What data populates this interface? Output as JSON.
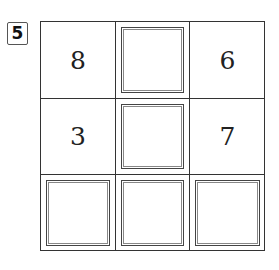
{
  "problem_number": "5",
  "grid": {
    "rows": [
      [
        {
          "value": "8",
          "blank": false
        },
        {
          "value": "",
          "blank": true
        },
        {
          "value": "6",
          "blank": false
        }
      ],
      [
        {
          "value": "3",
          "blank": false
        },
        {
          "value": "",
          "blank": true
        },
        {
          "value": "7",
          "blank": false
        }
      ],
      [
        {
          "value": "",
          "blank": true
        },
        {
          "value": "",
          "blank": true
        },
        {
          "value": "",
          "blank": true
        }
      ]
    ]
  }
}
